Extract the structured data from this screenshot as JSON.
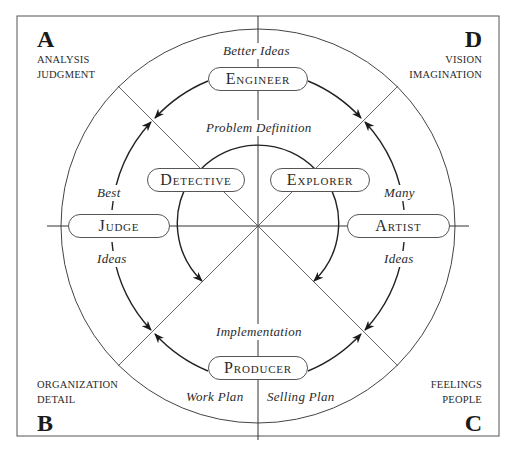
{
  "quadrants": {
    "A": {
      "letter": "A",
      "line1": "ANALYSIS",
      "line2": "JUDGMENT"
    },
    "D": {
      "letter": "D",
      "line1": "VISION",
      "line2": "IMAGINATION"
    },
    "B": {
      "letter": "B",
      "line1": "ORGANIZATION",
      "line2": "DETAIL"
    },
    "C": {
      "letter": "C",
      "line1": "FEELINGS",
      "line2": "PEOPLE"
    }
  },
  "roles": {
    "engineer": "Engineer",
    "detective": "Detective",
    "explorer": "Explorer",
    "judge": "Judge",
    "artist": "Artist",
    "producer": "Producer"
  },
  "labels": {
    "better_ideas": "Better Ideas",
    "problem_definition": "Problem Definition",
    "best": "Best",
    "ideas_left": "Ideas",
    "many": "Many",
    "ideas_right": "Ideas",
    "implementation": "Implementation",
    "work_plan": "Work Plan",
    "selling_plan": "Selling Plan"
  }
}
